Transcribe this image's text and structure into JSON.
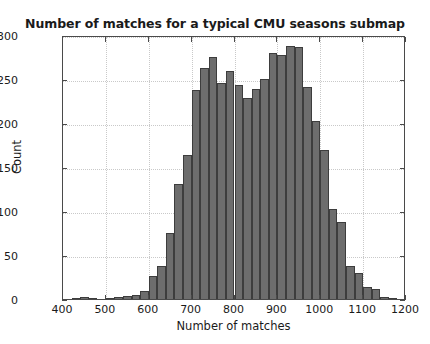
{
  "chart_data": {
    "type": "bar",
    "title": "Number of matches for a typical CMU seasons submap",
    "xlabel": "Number of matches",
    "ylabel": "Count",
    "xlim": [
      400,
      1200
    ],
    "ylim": [
      0,
      300
    ],
    "xticks": [
      400,
      500,
      600,
      700,
      800,
      900,
      1000,
      1100,
      1200
    ],
    "yticks": [
      0,
      50,
      100,
      150,
      200,
      250,
      300
    ],
    "grid": true,
    "legend": null,
    "bin_width": 20,
    "bar_color": "#6d6d6d",
    "bar_edge_color": "#3d3d3d",
    "bin_starts": [
      400,
      420,
      440,
      460,
      480,
      500,
      520,
      540,
      560,
      580,
      600,
      620,
      640,
      660,
      680,
      700,
      720,
      740,
      760,
      780,
      800,
      820,
      840,
      860,
      880,
      900,
      920,
      940,
      960,
      980,
      1000,
      1020,
      1040,
      1060,
      1080,
      1100,
      1120,
      1140,
      1160,
      1180
    ],
    "categories": [
      410,
      430,
      450,
      470,
      490,
      510,
      530,
      550,
      570,
      590,
      610,
      630,
      650,
      670,
      690,
      710,
      730,
      750,
      770,
      790,
      810,
      830,
      850,
      870,
      890,
      910,
      930,
      950,
      970,
      990,
      1010,
      1030,
      1050,
      1070,
      1090,
      1110,
      1130,
      1150,
      1170,
      1190
    ],
    "values": [
      0,
      1,
      2,
      1,
      0,
      1,
      2,
      3,
      5,
      9,
      26,
      38,
      75,
      131,
      164,
      238,
      262,
      275,
      246,
      259,
      243,
      228,
      239,
      250,
      279,
      277,
      288,
      286,
      241,
      202,
      169,
      102,
      88,
      37,
      30,
      14,
      11,
      2,
      1,
      0
    ]
  }
}
